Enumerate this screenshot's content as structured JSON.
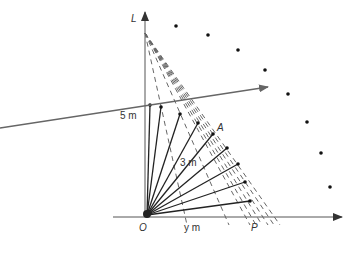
{
  "diagram": {
    "type": "geometry-ladder-sweep",
    "labels": {
      "vertical_axis": "L",
      "origin": "O",
      "height_label": "5 m",
      "ladder_label": "3 m",
      "point_a": "A",
      "point_p": "P",
      "distance_label": "y m"
    },
    "colors": {
      "axis": "#555555",
      "solid": "#222222",
      "dashed": "#666666",
      "dot": "#111111",
      "arrow": "#666666"
    },
    "origin": [
      145,
      217
    ],
    "top_point": [
      145,
      33
    ],
    "solid_ends": [
      [
        150,
        105
      ],
      [
        161,
        107
      ],
      [
        180,
        114
      ],
      [
        198,
        123
      ],
      [
        213,
        134
      ],
      [
        227,
        148
      ],
      [
        238,
        164
      ],
      [
        245,
        182
      ],
      [
        250,
        201
      ]
    ],
    "dashed_feet": [
      [
        187,
        225
      ],
      [
        229,
        225
      ],
      [
        250,
        225
      ],
      [
        256,
        225
      ],
      [
        262,
        225
      ],
      [
        268,
        225
      ],
      [
        274,
        225
      ],
      [
        280,
        225
      ]
    ],
    "arc_dots": [
      [
        176,
        26
      ],
      [
        208,
        35
      ],
      [
        238,
        50
      ],
      [
        265,
        70
      ],
      [
        288,
        94
      ],
      [
        307,
        122
      ],
      [
        321,
        153
      ],
      [
        330,
        187
      ]
    ],
    "sweep_arrow": {
      "from": [
        0,
        128
      ],
      "to": [
        268,
        87
      ]
    }
  }
}
